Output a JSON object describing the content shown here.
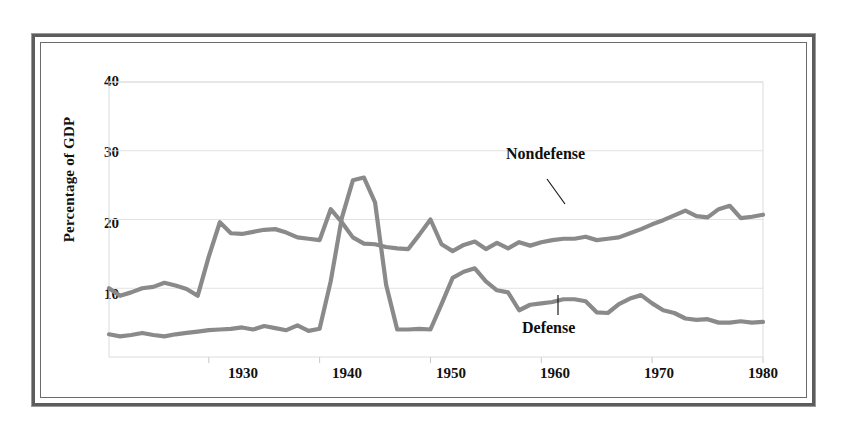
{
  "chart_data": {
    "type": "line",
    "title": "",
    "xlabel": "",
    "ylabel": "Percentage of GDP",
    "xlim": [
      1921,
      1980
    ],
    "ylim": [
      0,
      40
    ],
    "grid": true,
    "legend_position": "inline-annotation",
    "xticks": [
      "1930",
      "1940",
      "1950",
      "1960",
      "1970",
      "1980"
    ],
    "xtick_values": [
      1930,
      1940,
      1950,
      1960,
      1970,
      1980
    ],
    "yticks": [
      "10",
      "20",
      "30",
      "40"
    ],
    "ytick_values": [
      10,
      20,
      30,
      40
    ],
    "x": [
      1921,
      1922,
      1923,
      1924,
      1925,
      1926,
      1927,
      1928,
      1929,
      1930,
      1931,
      1932,
      1933,
      1934,
      1935,
      1936,
      1937,
      1938,
      1939,
      1940,
      1941,
      1942,
      1943,
      1944,
      1945,
      1946,
      1947,
      1948,
      1949,
      1950,
      1951,
      1952,
      1953,
      1954,
      1955,
      1956,
      1957,
      1958,
      1959,
      1960,
      1961,
      1962,
      1963,
      1964,
      1965,
      1966,
      1967,
      1968,
      1969,
      1970,
      1971,
      1972,
      1973,
      1974,
      1975,
      1976,
      1977,
      1978,
      1979,
      1980
    ],
    "series": [
      {
        "name": "Nondefense",
        "color": "#8a8a8a",
        "values": [
          10.0,
          8.9,
          9.4,
          10.0,
          10.2,
          10.8,
          10.4,
          9.9,
          8.9,
          14.6,
          19.6,
          18.0,
          17.9,
          18.2,
          18.5,
          18.6,
          18.1,
          17.4,
          17.2,
          17.0,
          21.5,
          19.6,
          17.4,
          16.5,
          16.4,
          16.0,
          15.8,
          15.7,
          17.8,
          20.0,
          16.4,
          15.4,
          16.3,
          16.8,
          15.7,
          16.6,
          15.8,
          16.7,
          16.2,
          16.7,
          17.0,
          17.2,
          17.2,
          17.5,
          17.0,
          17.2,
          17.4,
          18.0,
          18.6,
          19.3,
          19.9,
          20.6,
          21.3,
          20.5,
          20.3,
          21.5,
          22.0,
          20.2,
          20.4,
          20.7
        ]
      },
      {
        "name": "Defense",
        "color": "#8a8a8a",
        "values": [
          3.3,
          3.0,
          3.2,
          3.5,
          3.2,
          3.0,
          3.3,
          3.5,
          3.7,
          3.9,
          4.0,
          4.1,
          4.3,
          4.0,
          4.5,
          4.2,
          3.9,
          4.6,
          3.8,
          4.1,
          11.0,
          20.2,
          25.7,
          26.1,
          22.5,
          10.5,
          4.0,
          4.0,
          4.1,
          4.0,
          7.7,
          11.5,
          12.4,
          12.9,
          11.0,
          9.7,
          9.4,
          6.8,
          7.6,
          7.8,
          8.0,
          8.4,
          8.4,
          8.1,
          6.5,
          6.4,
          7.7,
          8.5,
          9.0,
          7.8,
          6.8,
          6.4,
          5.6,
          5.4,
          5.5,
          5.0,
          5.0,
          5.2,
          5.0,
          5.1
        ]
      }
    ],
    "annotations": [
      {
        "text": "Nondefense",
        "x_pct": 63.0,
        "y_pct": 20.0
      },
      {
        "text": "Defense",
        "x_pct": 62.5,
        "y_pct": 80.0
      }
    ]
  },
  "figure": {
    "axis_title_y": "Percentage of GDP",
    "nondefense_label": "Nondefense",
    "defense_label": "Defense",
    "ytick_40": "40",
    "ytick_30": "30",
    "ytick_20": "20",
    "ytick_10": "10",
    "xtick_1930": "1930",
    "xtick_1940": "1940",
    "xtick_1950": "1950",
    "xtick_1960": "1960",
    "xtick_1970": "1970",
    "xtick_1980": "1980"
  },
  "colors": {
    "line": "#8a8a8a",
    "grid": "#e2e2e2",
    "frame": "#5c5c5c",
    "text": "#111111",
    "background": "#ffffff"
  }
}
